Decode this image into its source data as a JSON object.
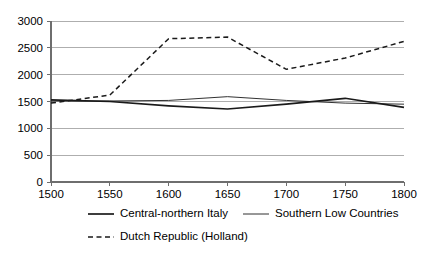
{
  "chart_data": {
    "type": "line",
    "title": "",
    "subtitle": "",
    "xlabel": "",
    "ylabel": "",
    "x": [
      1500,
      1550,
      1600,
      1650,
      1700,
      1750,
      1800
    ],
    "xlim": [
      1500,
      1800
    ],
    "ylim": [
      0,
      3000
    ],
    "grid": "horizontal",
    "legend_position": "bottom",
    "xticks": [
      "1500",
      "1550",
      "1600",
      "1650",
      "1700",
      "1750",
      "1800"
    ],
    "yticks": [
      "0",
      "500",
      "1000",
      "1500",
      "2000",
      "2500",
      "3000"
    ],
    "ytick_values": [
      0,
      500,
      1000,
      1500,
      2000,
      2500,
      3000
    ],
    "series": [
      {
        "name": "Central-northern Italy",
        "style": "solid-thick",
        "color": "#1a1a1a",
        "values": [
          1530,
          1500,
          1420,
          1360,
          1450,
          1560,
          1390
        ]
      },
      {
        "name": "Southern Low Countries",
        "style": "solid-thin",
        "color": "#1a1a1a",
        "values": [
          1510,
          1510,
          1520,
          1590,
          1520,
          1470,
          1450
        ]
      },
      {
        "name": "Dutch Republic (Holland)",
        "style": "dashed",
        "color": "#1a1a1a",
        "values": [
          1470,
          1620,
          2670,
          2700,
          2100,
          2310,
          2620
        ]
      }
    ]
  },
  "legend": {
    "entries": [
      {
        "label": "Central-northern Italy",
        "swatch": "solid-thick"
      },
      {
        "label": "Southern Low Countries",
        "swatch": "solid-thin"
      },
      {
        "label": "Dutch Republic (Holland)",
        "swatch": "dashed"
      }
    ]
  }
}
